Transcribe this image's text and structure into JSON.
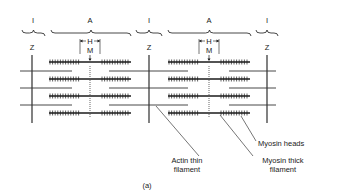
{
  "figure": {
    "caption": "(a)",
    "band_labels": {
      "i_band": "I",
      "a_band": "A",
      "h_zone": "H",
      "m_line": "M",
      "z_line": "Z"
    },
    "sarcomeres": [
      {
        "z_left": 32,
        "z_right": 149,
        "m_center": 90
      },
      {
        "z_left": 149,
        "z_right": 267,
        "m_center": 209
      }
    ],
    "callouts": {
      "myosin_heads": "Myosin heads",
      "actin_thin_filament_line1": "Actin thin",
      "actin_thin_filament_line2": "filament",
      "myosin_thick_filament_line1": "Myosin thick",
      "myosin_thick_filament_line2": "filament"
    },
    "colors": {
      "ink": "#1a1a1a",
      "actin": "#333333",
      "background": "#ffffff"
    }
  }
}
